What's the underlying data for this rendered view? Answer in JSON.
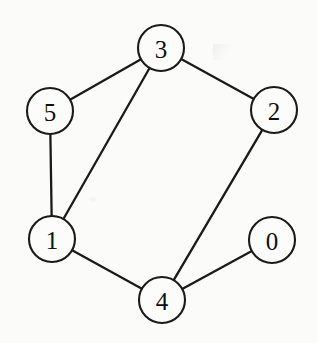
{
  "figure": {
    "background_color": "#fbfbfa",
    "stroke_color": "#1a1a1a",
    "node_fill_color": "#fcfcfb",
    "width": 317,
    "height": 343
  },
  "graph_data": {
    "type": "node-link-diagram",
    "directed": false,
    "node_radius": 23,
    "nodes": [
      {
        "id": "0",
        "label": "0",
        "cx": 272,
        "cy": 240
      },
      {
        "id": "1",
        "label": "1",
        "cx": 52,
        "cy": 239
      },
      {
        "id": "2",
        "label": "2",
        "cx": 274,
        "cy": 110
      },
      {
        "id": "3",
        "label": "3",
        "cx": 161,
        "cy": 48
      },
      {
        "id": "4",
        "label": "4",
        "cx": 162,
        "cy": 300
      },
      {
        "id": "5",
        "label": "5",
        "cx": 50,
        "cy": 111
      }
    ],
    "edges": [
      {
        "source": "5",
        "target": "3"
      },
      {
        "source": "3",
        "target": "2"
      },
      {
        "source": "5",
        "target": "1"
      },
      {
        "source": "3",
        "target": "1"
      },
      {
        "source": "1",
        "target": "4"
      },
      {
        "source": "4",
        "target": "2"
      },
      {
        "source": "4",
        "target": "0"
      }
    ]
  }
}
